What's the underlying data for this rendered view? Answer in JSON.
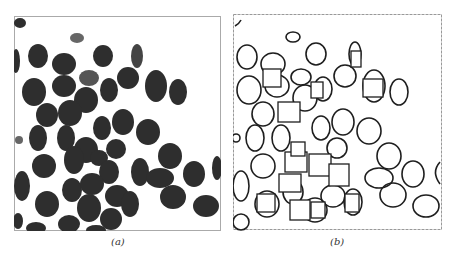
{
  "figure": {
    "panels": [
      {
        "id": "a",
        "caption": "(a)",
        "description": "grayscale image of dark oval cells on white background"
      },
      {
        "id": "b",
        "caption": "(b)",
        "description": "detected cell contours with rectangular fitting boxes"
      }
    ],
    "colors": {
      "cell_fill": "#2b2b2b",
      "background": "#ffffff",
      "outline": "#1a1a1a"
    }
  }
}
